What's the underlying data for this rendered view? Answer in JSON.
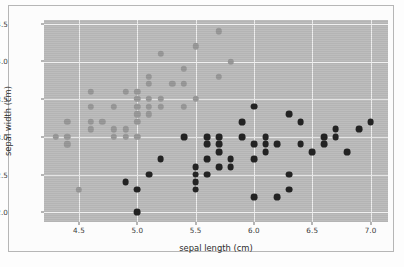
{
  "chart_data": {
    "type": "scatter",
    "title": "",
    "xlabel": "sepal length (cm)",
    "ylabel": "sepal width (cm)",
    "xlim": [
      4.2,
      7.15
    ],
    "ylim": [
      1.87,
      4.55
    ],
    "xticks": [
      "4.5",
      "5.0",
      "5.5",
      "6.0",
      "6.5",
      "7.0"
    ],
    "xtick_values": [
      4.5,
      5.0,
      5.5,
      6.0,
      6.5,
      7.0
    ],
    "yticks": [
      "2.0",
      "2.5",
      "3.0",
      "3.5",
      "4.0",
      "4.5"
    ],
    "ytick_values": [
      2.0,
      2.5,
      3.0,
      3.5,
      4.0,
      4.5
    ],
    "grid": true,
    "legend": "none",
    "background_color": "#bdbdbd",
    "gridline_color": "#f0f0f0",
    "series": [
      {
        "name": "class-0",
        "marker": "circle",
        "color": "#9a9a9a",
        "points": [
          [
            4.3,
            3.0
          ],
          [
            4.4,
            3.2
          ],
          [
            4.4,
            3.0
          ],
          [
            4.4,
            2.9
          ],
          [
            4.5,
            2.3
          ],
          [
            4.6,
            3.6
          ],
          [
            4.6,
            3.4
          ],
          [
            4.6,
            3.2
          ],
          [
            4.6,
            3.1
          ],
          [
            4.7,
            3.2
          ],
          [
            4.8,
            3.4
          ],
          [
            4.8,
            3.1
          ],
          [
            4.8,
            3.0
          ],
          [
            4.9,
            3.6
          ],
          [
            4.9,
            3.1
          ],
          [
            4.9,
            3.0
          ],
          [
            5.0,
            3.6
          ],
          [
            5.0,
            3.5
          ],
          [
            5.0,
            3.4
          ],
          [
            5.0,
            3.3
          ],
          [
            5.0,
            3.2
          ],
          [
            5.0,
            3.0
          ],
          [
            5.1,
            3.8
          ],
          [
            5.1,
            3.7
          ],
          [
            5.1,
            3.5
          ],
          [
            5.1,
            3.4
          ],
          [
            5.1,
            3.3
          ],
          [
            5.2,
            4.1
          ],
          [
            5.2,
            3.5
          ],
          [
            5.2,
            3.4
          ],
          [
            5.3,
            3.7
          ],
          [
            5.4,
            3.9
          ],
          [
            5.4,
            3.7
          ],
          [
            5.4,
            3.4
          ],
          [
            5.5,
            4.2
          ],
          [
            5.5,
            3.5
          ],
          [
            5.7,
            4.4
          ],
          [
            5.7,
            3.8
          ],
          [
            5.8,
            4.0
          ]
        ]
      },
      {
        "name": "class-1",
        "marker": "circle",
        "color": "#242424",
        "points": [
          [
            4.9,
            2.4
          ],
          [
            5.0,
            2.3
          ],
          [
            5.0,
            2.0
          ],
          [
            5.1,
            2.5
          ],
          [
            5.2,
            2.7
          ],
          [
            5.4,
            3.0
          ],
          [
            5.5,
            2.6
          ],
          [
            5.5,
            2.5
          ],
          [
            5.5,
            2.4
          ],
          [
            5.5,
            2.3
          ],
          [
            5.6,
            3.0
          ],
          [
            5.6,
            2.9
          ],
          [
            5.6,
            2.7
          ],
          [
            5.6,
            2.5
          ],
          [
            5.7,
            3.0
          ],
          [
            5.7,
            2.9
          ],
          [
            5.7,
            2.8
          ],
          [
            5.7,
            2.6
          ],
          [
            5.8,
            2.7
          ],
          [
            5.8,
            2.6
          ],
          [
            5.9,
            3.2
          ],
          [
            5.9,
            3.0
          ],
          [
            6.0,
            3.4
          ],
          [
            6.0,
            2.9
          ],
          [
            6.0,
            2.7
          ],
          [
            6.0,
            2.2
          ],
          [
            6.1,
            3.0
          ],
          [
            6.1,
            2.9
          ],
          [
            6.1,
            2.8
          ],
          [
            6.2,
            2.9
          ],
          [
            6.2,
            2.2
          ],
          [
            6.3,
            3.3
          ],
          [
            6.3,
            2.5
          ],
          [
            6.3,
            2.3
          ],
          [
            6.4,
            3.2
          ],
          [
            6.4,
            2.9
          ],
          [
            6.5,
            2.8
          ],
          [
            6.6,
            3.0
          ],
          [
            6.6,
            2.9
          ],
          [
            6.7,
            3.1
          ],
          [
            6.7,
            3.0
          ],
          [
            6.8,
            2.8
          ],
          [
            6.9,
            3.1
          ],
          [
            7.0,
            3.2
          ]
        ]
      }
    ]
  }
}
